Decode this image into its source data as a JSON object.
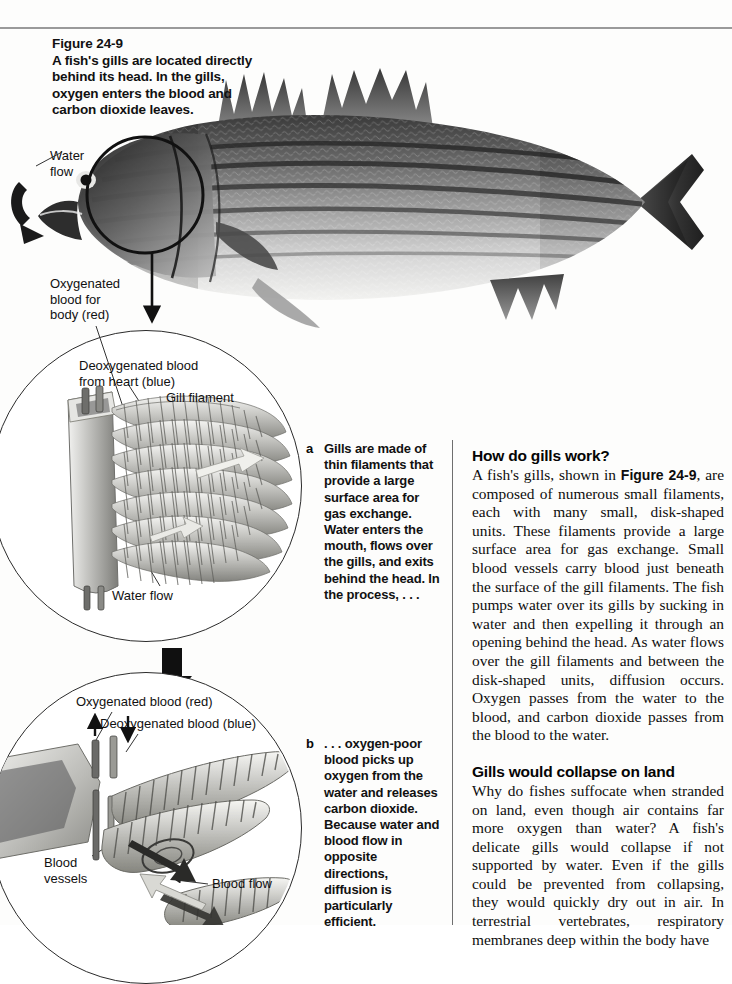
{
  "figure": {
    "number": "Figure 24-9",
    "caption": "A fish's gills are located directly behind its head. In the gills, oxygen enters the blood and carbon dioxide leaves."
  },
  "photo_labels": {
    "water_flow": "Water\nflow",
    "oxygenated_blood_body": "Oxygenated\nblood for\nbody (red)"
  },
  "diagram_a_labels": {
    "deoxygenated_blood_heart": "Deoxygenated blood\nfrom heart (blue)",
    "gill_filament": "Gill filament",
    "water_flow": "Water flow"
  },
  "diagram_b_labels": {
    "oxygenated_blood_red": "Oxygenated blood (red)",
    "deoxygenated_blood_blue": "Deoxygenated blood (blue)",
    "blood_vessels": "Blood\nvessels",
    "blood_flow": "Blood flow"
  },
  "captions": {
    "a": {
      "marker": "a",
      "text": "Gills are made of thin filaments that provide a large surface area for gas exchange. Water enters the mouth, flows over the gills, and exits behind the head. In the process, . . ."
    },
    "b": {
      "marker": "b",
      "text": ". . . oxygen-poor blood picks up oxygen from the water and releases carbon dioxide. Because water and blood flow in opposite directions, diffusion is particularly efficient."
    }
  },
  "article": {
    "section1": {
      "heading": "How do gills work?",
      "lead_plain": "A fish's gills, shown in ",
      "lead_bold": "Figure 24-9",
      "body": ", are composed of numerous small filaments, each with many small, disk-shaped units. These filaments provide a large surface area for gas exchange. Small blood vessels carry blood just beneath the surface of the gill filaments. The fish pumps water over its gills by sucking in water and then expelling it through an opening behind the head. As water flows over the gill filaments and between the disk-shaped units, diffusion occurs. Oxygen passes from the water to the blood, and carbon dioxide passes from the blood to the water."
    },
    "section2": {
      "heading": "Gills would collapse on land",
      "body": "Why do fishes suffocate when stranded on land, even though air contains far more oxygen than water? A fish's delicate gills would collapse if not supported by water. Even if the gills could be prevented from collapsing, they would quickly dry out in air. In terrestrial vertebrates, respiratory membranes deep within the body have"
    }
  },
  "colors": {
    "ink": "#111111",
    "rule": "#9a9a9a",
    "divider": "#6f6f6f",
    "paper": "#fdfdfc"
  }
}
